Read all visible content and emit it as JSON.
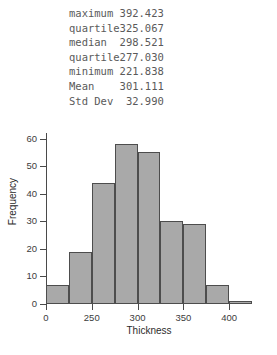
{
  "stats": {
    "rows": [
      {
        "label": "maximum",
        "value": "392.423"
      },
      {
        "label": "quartile",
        "value": "325.067"
      },
      {
        "label": "median",
        "value": "298.521"
      },
      {
        "label": "quartile",
        "value": "277.030"
      },
      {
        "label": "minimum",
        "value": "221.838"
      },
      {
        "label": "Mean",
        "value": "301.111"
      },
      {
        "label": "Std Dev",
        "value": "32.990"
      }
    ]
  },
  "chart_data": {
    "type": "bar",
    "title": "",
    "xlabel": "Thickness",
    "ylabel": "Frequency",
    "categories": [
      "200-225",
      "225-250",
      "250-275",
      "275-300",
      "300-325",
      "325-350",
      "350-375",
      "375-400",
      "400-425"
    ],
    "bin_starts": [
      200,
      225,
      250,
      275,
      300,
      325,
      350,
      375,
      400
    ],
    "bin_width": 25,
    "values": [
      7,
      19,
      44,
      58,
      55,
      30,
      29,
      7,
      1
    ],
    "xlim": [
      200,
      425
    ],
    "ylim": [
      0,
      62
    ],
    "xtick_labels": [
      "0",
      "250",
      "300",
      "350",
      "400"
    ],
    "xtick_values": [
      200,
      250,
      300,
      350,
      400
    ],
    "ytick_labels": [
      "0",
      "10",
      "20",
      "30",
      "40",
      "50",
      "60"
    ],
    "ytick_values": [
      0,
      10,
      20,
      30,
      40,
      50,
      60
    ],
    "grid": false,
    "legend": "none",
    "bar_fill_color": "#a9a9a9",
    "bar_edge_color": "#4d4d4d",
    "axis_color": "#4a4a4a"
  }
}
